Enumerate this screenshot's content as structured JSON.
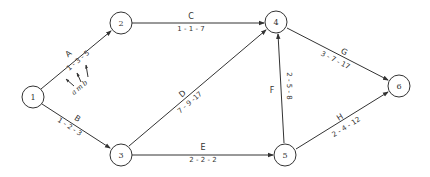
{
  "diagram": {
    "type": "PERT network",
    "nodes": [
      {
        "id": "1",
        "label": "1"
      },
      {
        "id": "2",
        "label": "2"
      },
      {
        "id": "3",
        "label": "3"
      },
      {
        "id": "4",
        "label": "4"
      },
      {
        "id": "5",
        "label": "5"
      },
      {
        "id": "6",
        "label": "6"
      }
    ],
    "edges": [
      {
        "activity": "A",
        "from": "1",
        "to": "2",
        "estimates": "1 - 3 - 5"
      },
      {
        "activity": "B",
        "from": "1",
        "to": "3",
        "estimates": "1 - 2 - 3"
      },
      {
        "activity": "C",
        "from": "2",
        "to": "4",
        "estimates": "1 - 1 - 7"
      },
      {
        "activity": "D",
        "from": "3",
        "to": "4",
        "estimates": "7 - 9 -17"
      },
      {
        "activity": "E",
        "from": "3",
        "to": "5",
        "estimates": "2 - 2 - 2"
      },
      {
        "activity": "F",
        "from": "5",
        "to": "4",
        "estimates": "2 - 5 - 8"
      },
      {
        "activity": "G",
        "from": "4",
        "to": "6",
        "estimates": "3 - 7 - 17"
      },
      {
        "activity": "H",
        "from": "5",
        "to": "6",
        "estimates": "2 - 4 - 12"
      }
    ],
    "legend": {
      "a": "a",
      "m": "m",
      "b": "b"
    }
  }
}
